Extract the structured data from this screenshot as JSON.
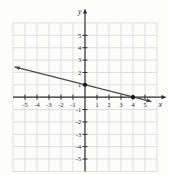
{
  "figure": {
    "background": "#fdfdfb"
  },
  "chart_data": {
    "type": "line",
    "title": "",
    "xlabel": "x",
    "ylabel": "y",
    "xlim": [
      -6,
      6
    ],
    "ylim": [
      -6,
      6
    ],
    "grid": true,
    "legend": false,
    "x_ticks": {
      "values": [
        -5,
        -4,
        -3,
        -2,
        -1,
        1,
        2,
        3,
        4,
        5
      ],
      "labels": [
        "-5",
        "-4",
        "-3",
        "-2",
        "-1",
        "1",
        "2",
        "3",
        "4",
        "5"
      ]
    },
    "y_ticks": {
      "values": [
        5,
        4,
        3,
        2,
        1,
        -1,
        -2,
        -3,
        -4,
        -5
      ],
      "labels": [
        "5",
        "4",
        "3",
        "2",
        "1",
        "-1",
        "-2",
        "-3",
        "-4",
        "-5"
      ]
    },
    "series": [
      {
        "name": "plotted-line",
        "type": "line",
        "slope": -0.25,
        "y_intercept": 1,
        "x_intercept": 4,
        "marked_points": [
          [
            0,
            1
          ],
          [
            4,
            0
          ]
        ],
        "segment_endpoints": [
          [
            -5.87,
            2.45
          ],
          [
            5.54,
            -0.35
          ]
        ],
        "arrow_start": true,
        "arrow_end": true
      }
    ],
    "colors": {
      "background": "#fdfdfb",
      "grid": "#d2d6db",
      "axis": "#2f2f2f",
      "line": "#4a4a4a",
      "point": "#161616",
      "tick_label": "#2b2b2b"
    }
  }
}
